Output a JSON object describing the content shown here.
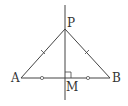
{
  "diagram": {
    "labels": {
      "P": "P",
      "A": "A",
      "B": "B",
      "M": "M"
    },
    "stroke_color": "#444444"
  }
}
